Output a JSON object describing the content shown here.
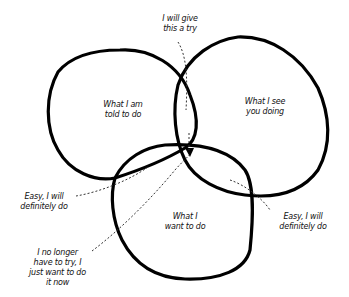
{
  "diagram": {
    "type": "venn",
    "circles": [
      {
        "id": "told",
        "label_lines": [
          "What I am",
          "told to do"
        ]
      },
      {
        "id": "see",
        "label_lines": [
          "What I see",
          "you doing"
        ]
      },
      {
        "id": "want",
        "label_lines": [
          "What I",
          "want to do"
        ]
      }
    ],
    "annotations": [
      {
        "id": "top",
        "lines": [
          "I will give",
          "this a try"
        ],
        "points_to": "told ∩ see"
      },
      {
        "id": "left",
        "lines": [
          "Easy, I will",
          "definitely do"
        ],
        "points_to": "told ∩ want"
      },
      {
        "id": "right",
        "lines": [
          "Easy, I will",
          "definitely do"
        ],
        "points_to": "see ∩ want"
      },
      {
        "id": "bottom",
        "lines": [
          "I no longer",
          "have to try, I",
          "just want to do",
          "it now"
        ],
        "points_to": "told ∩ see ∩ want"
      }
    ],
    "colors": {
      "stroke": "#000000",
      "background": "#ffffff",
      "text": "#111111"
    }
  }
}
